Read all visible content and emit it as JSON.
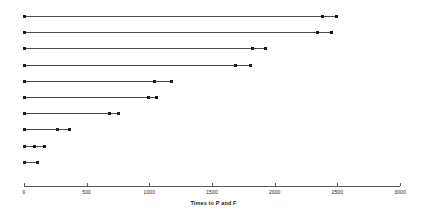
{
  "chart_data": {
    "type": "scatter",
    "title": "",
    "subtitle": "",
    "xlabel": "Times to P and F",
    "ylabel": "",
    "xlim": [
      0,
      3000
    ],
    "xticks": [
      0,
      500,
      1000,
      1500,
      2000,
      2500,
      3000
    ],
    "xtick_labels": [
      "0",
      "500",
      "1000",
      "1500",
      "2000",
      "2500",
      "3000"
    ],
    "grid": false,
    "legend": null,
    "series": [
      {
        "name": "subject-1",
        "row": 1,
        "values": [
          0,
          2380,
          2490
        ]
      },
      {
        "name": "subject-2",
        "row": 2,
        "values": [
          0,
          2345,
          2450
        ]
      },
      {
        "name": "subject-3",
        "row": 3,
        "values": [
          0,
          1820,
          1930
        ]
      },
      {
        "name": "subject-4",
        "row": 4,
        "values": [
          0,
          1690,
          1805
        ]
      },
      {
        "name": "subject-5",
        "row": 5,
        "values": [
          0,
          1045,
          1175
        ]
      },
      {
        "name": "subject-6",
        "row": 6,
        "values": [
          0,
          990,
          1060
        ]
      },
      {
        "name": "subject-7",
        "row": 7,
        "values": [
          0,
          685,
          750
        ]
      },
      {
        "name": "subject-8",
        "row": 8,
        "values": [
          0,
          270,
          365
        ]
      },
      {
        "name": "subject-9",
        "row": 9,
        "values": [
          0,
          80,
          160
        ]
      },
      {
        "name": "subject-10",
        "row": 10,
        "values": [
          0,
          110
        ]
      }
    ],
    "colors": {
      "point": "#1a1a1a",
      "line": "#4a4a4a",
      "axis": "#5a5a5a",
      "background": "#ffffff"
    }
  }
}
